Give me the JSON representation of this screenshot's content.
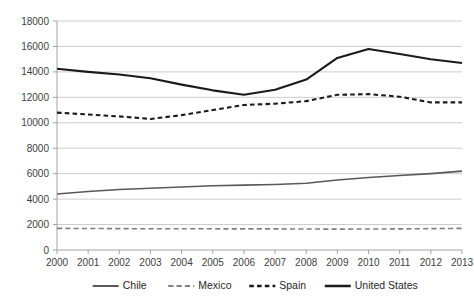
{
  "chart_data": {
    "type": "line",
    "title": "",
    "subtitle": "",
    "xlabel": "",
    "ylabel": "",
    "categories": [
      "2000",
      "2001",
      "2002",
      "2003",
      "2004",
      "2005",
      "2006",
      "2007",
      "2008",
      "2009",
      "2010",
      "2011",
      "2012",
      "2013"
    ],
    "x": [
      2000,
      2001,
      2002,
      2003,
      2004,
      2005,
      2006,
      2007,
      2008,
      2009,
      2010,
      2011,
      2012,
      2013
    ],
    "ylim": [
      0,
      18000
    ],
    "yticks": [
      0,
      2000,
      4000,
      6000,
      8000,
      10000,
      12000,
      14000,
      16000,
      18000
    ],
    "ytick_labels": [
      "0",
      "2000",
      "4000",
      "6000",
      "8000",
      "10000",
      "12000",
      "14000",
      "16000",
      "18000"
    ],
    "grid": true,
    "legend_position": "bottom",
    "series": [
      {
        "name": "Chile",
        "color": "#595959",
        "style": "solid",
        "width": 1.6,
        "values": [
          4400,
          4600,
          4750,
          4850,
          4950,
          5050,
          5100,
          5150,
          5250,
          5500,
          5700,
          5850,
          6000,
          6200
        ]
      },
      {
        "name": "Mexico",
        "color": "#7f7f7f",
        "style": "long-dash",
        "width": 1.6,
        "values": [
          1700,
          1690,
          1680,
          1670,
          1670,
          1665,
          1660,
          1660,
          1650,
          1640,
          1650,
          1660,
          1680,
          1700
        ]
      },
      {
        "name": "Spain",
        "color": "#1a1a1a",
        "style": "short-dash",
        "width": 2.1,
        "values": [
          10800,
          10650,
          10500,
          10300,
          10600,
          11000,
          11400,
          11500,
          11700,
          12200,
          12250,
          12050,
          11600,
          11600
        ]
      },
      {
        "name": "United States",
        "color": "#1a1a1a",
        "style": "solid",
        "width": 2.1,
        "values": [
          14250,
          14000,
          13800,
          13500,
          13000,
          12550,
          12200,
          12600,
          13400,
          15100,
          15800,
          15400,
          15000,
          14700
        ]
      }
    ]
  },
  "legend": {
    "items": [
      {
        "label": "Chile"
      },
      {
        "label": "Mexico"
      },
      {
        "label": "Spain"
      },
      {
        "label": "United States"
      }
    ]
  }
}
